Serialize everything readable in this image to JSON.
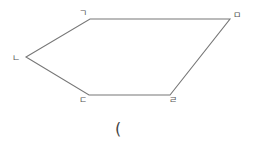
{
  "diagram": {
    "type": "pentagon",
    "stroke_color": "#777777",
    "vertices": [
      {
        "label": "ㄱ",
        "x": 90,
        "y": 19,
        "lx": 83,
        "ly": 16
      },
      {
        "label": "ㅁ",
        "x": 230,
        "y": 19,
        "lx": 237,
        "ly": 18
      },
      {
        "label": "ㄹ",
        "x": 170,
        "y": 95,
        "lx": 173,
        "ly": 103
      },
      {
        "label": "ㄷ",
        "x": 89,
        "y": 95,
        "lx": 83,
        "ly": 103
      },
      {
        "label": "ㄴ",
        "x": 26,
        "y": 57,
        "lx": 16,
        "ly": 61
      }
    ],
    "caption": "("
  }
}
